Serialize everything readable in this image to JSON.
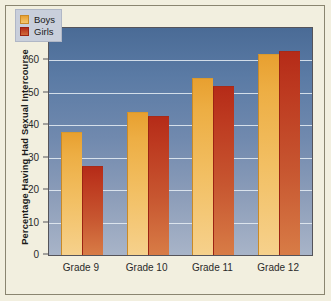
{
  "chart_data": {
    "type": "bar",
    "title": "",
    "subtitle": "",
    "xlabel": "",
    "ylabel": "Percentage Having Had Sexual Intercourse",
    "categories": [
      "Grade 9",
      "Grade 10",
      "Grade 11",
      "Grade 12"
    ],
    "series": [
      {
        "name": "Boys",
        "color": "#eda93c",
        "values": [
          38,
          44,
          54.5,
          62
        ]
      },
      {
        "name": "Girls",
        "color": "#bd3a20",
        "values": [
          27.5,
          43,
          52,
          63
        ]
      }
    ],
    "ylim": [
      0,
      70
    ],
    "ytick_labels": [
      "70",
      "60",
      "50",
      "40",
      "30",
      "20",
      "10",
      "0"
    ],
    "ytick_values": [
      70,
      60,
      50,
      40,
      30,
      20,
      10,
      0
    ],
    "grid": true,
    "gridline_values": [
      60,
      50,
      40,
      30,
      20,
      10
    ],
    "legend_position": "top-left",
    "legend_entries": [
      "Boys",
      "Girls"
    ],
    "plot_background": "blue-vertical-gradient",
    "figure_background": "#f2efdf"
  }
}
